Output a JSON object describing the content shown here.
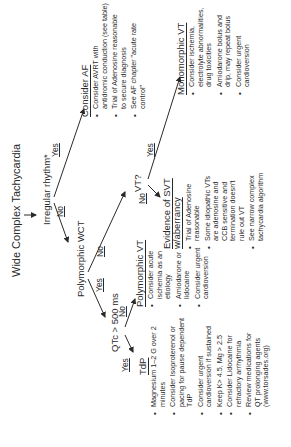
{
  "diagram": {
    "root": "Wide Complex Tachycardia",
    "decision_irregular": "Irregular rhythm*",
    "irregular_yes": "Yes",
    "irregular_no": "No",
    "consider_af": {
      "heading": "Consider AF",
      "bullets": [
        "Consider AVRT with",
        "antidromic conduction (see table)",
        "Trial of Adenosine reasonable",
        "to secure diagnosis",
        "See AF chapter \"acute rate",
        "control\""
      ]
    },
    "polymorphic_wct": "Polymorphic WCT",
    "poly_yes": "Yes",
    "poly_no": "No",
    "qtc": "QTc > 500 ms",
    "qtc_yes": "Yes",
    "qtc_no": "No",
    "vt_question": "VT?",
    "vt_yes": "Yes",
    "vt_no": "No",
    "tdp": {
      "heading": "TdP",
      "bullets": [
        [
          "Magnesium 1–2 G over 2",
          "minutes"
        ],
        [
          "Consider Isoproterenol or",
          "pacing for pause dependent",
          "TdP"
        ],
        [
          "Consider urgent",
          "cardioversion if sustained"
        ],
        [
          "Keep K> 4.5, Mg > 2.5"
        ],
        [
          "Consider Lidocaine for",
          "refractory arrhythmia"
        ],
        [
          "Review medications for",
          "QT prolonging agents",
          "(www.torsades.org)"
        ]
      ]
    },
    "polymorphic_vt": {
      "heading": "Polymorphic VT",
      "bullets": [
        [
          "Consider acute",
          "ischemia as an",
          "etiology"
        ],
        [
          "Amiodarone or",
          "lidocaine"
        ],
        [
          "Consider urgent",
          "cardioversion"
        ]
      ]
    },
    "svt_aberrancy": {
      "heading_line1": "Evidence of SVT",
      "heading_line2": "w/aberrancy",
      "bullets": [
        [
          "Trial of Adenosine",
          "reasonable"
        ],
        [
          "Some idiopathic VTs",
          "are adenosine and",
          "CCB sensitive and",
          "termination doesn't",
          "rule out VT"
        ],
        [
          "See narrow complex",
          "tachycardia algorithm"
        ]
      ]
    },
    "monomorphic_vt": {
      "heading": "Monomorphic VT",
      "bullets": [
        [
          "Consider ischemia,",
          "electrolyte abnormalities,",
          "drug toxicities"
        ],
        [
          "Amiodarone bolus and",
          "drip, may repeat bolus"
        ],
        [
          "Consider urgent",
          "cardioversion"
        ]
      ]
    }
  },
  "colors": {
    "ink": "#2a2a2a",
    "background": "#ffffff"
  }
}
